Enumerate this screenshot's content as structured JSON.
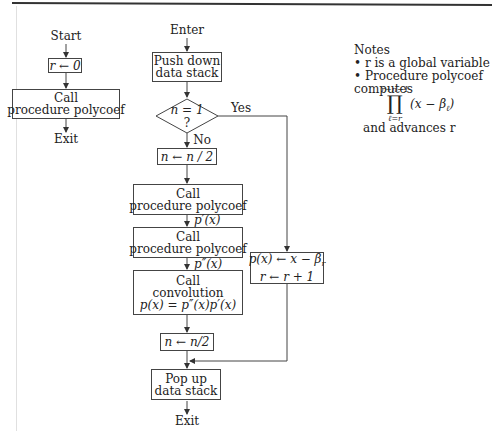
{
  "left_flow": {
    "start": "Start",
    "init": "r ← 0",
    "call_line1": "Call",
    "call_line2": "procedure polycoef",
    "exit": "Exit"
  },
  "main_flow": {
    "enter": "Enter",
    "push_line1": "Push down",
    "push_line2": "data stack",
    "decision_line1": "n = 1",
    "decision_line2": "?",
    "yes_label": "Yes",
    "no_label": "No",
    "halve1": "n ← n / 2",
    "call1_line1": "Call",
    "call1_line2": "procedure polycoef",
    "edge1_label": "p′(x)",
    "call2_line1": "Call",
    "call2_line2": "procedure polycoef",
    "edge2_label": "p″(x)",
    "conv_line1": "Call",
    "conv_line2": "convolution",
    "conv_line3": "p(x) = p″(x)p′(x)",
    "halve2": "n ← n/2",
    "pop_line1": "Pop up",
    "pop_line2": "data stack",
    "exit": "Exit"
  },
  "yes_branch": {
    "line1": "p(x) ← x − β_r",
    "line1_main": "p(x) ← x − β",
    "line1_sub": "r",
    "line2": "r ← r + 1"
  },
  "notes": {
    "title": "Notes",
    "bullet1": "• r is a global variable",
    "bullet2": "• Procedure polycoef computes",
    "product_upper": "r+n−1",
    "product_symbol": "∏",
    "product_lower": "ℓ=r",
    "product_term": "(x − β",
    "product_term_sub": "ℓ",
    "product_term_close": ")",
    "last_line": "and advances r"
  }
}
